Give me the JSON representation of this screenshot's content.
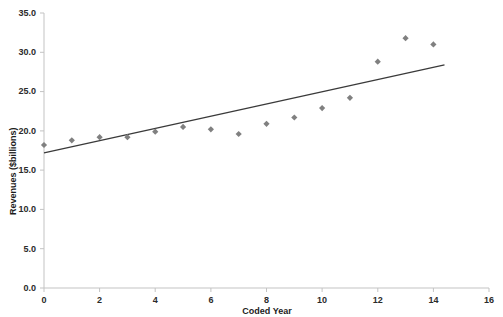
{
  "chart_data": {
    "type": "scatter",
    "title": "",
    "xlabel": "Coded Year",
    "ylabel": "Revenues ($billions)",
    "xlim": [
      0,
      16
    ],
    "ylim": [
      0.0,
      35.0
    ],
    "xticks": [
      "0",
      "2",
      "4",
      "6",
      "8",
      "10",
      "12",
      "14",
      "16"
    ],
    "xtick_values": [
      0,
      2,
      4,
      6,
      8,
      10,
      12,
      14,
      16
    ],
    "yticks": [
      "0.0",
      "5.0",
      "10.0",
      "15.0",
      "20.0",
      "25.0",
      "30.0",
      "35.0"
    ],
    "ytick_values": [
      0.0,
      5.0,
      10.0,
      15.0,
      20.0,
      25.0,
      30.0,
      35.0
    ],
    "grid": false,
    "legend": "none",
    "marker": "diamond",
    "marker_color": "#808080",
    "series": [
      {
        "name": "Revenues",
        "x": [
          0,
          1,
          2,
          3,
          4,
          5,
          6,
          7,
          8,
          9,
          10,
          11,
          12,
          13,
          14
        ],
        "values": [
          18.2,
          18.8,
          19.2,
          19.2,
          19.9,
          20.5,
          20.2,
          19.6,
          20.9,
          21.7,
          22.9,
          24.2,
          28.8,
          31.8,
          31.0
        ]
      }
    ],
    "trendline": {
      "name": "Linear trend",
      "color": "#3a3a3a",
      "x_start": 0.0,
      "y_start": 17.2,
      "x_end": 14.4,
      "y_end": 28.4
    },
    "axis_color": "#bfbfbf"
  }
}
